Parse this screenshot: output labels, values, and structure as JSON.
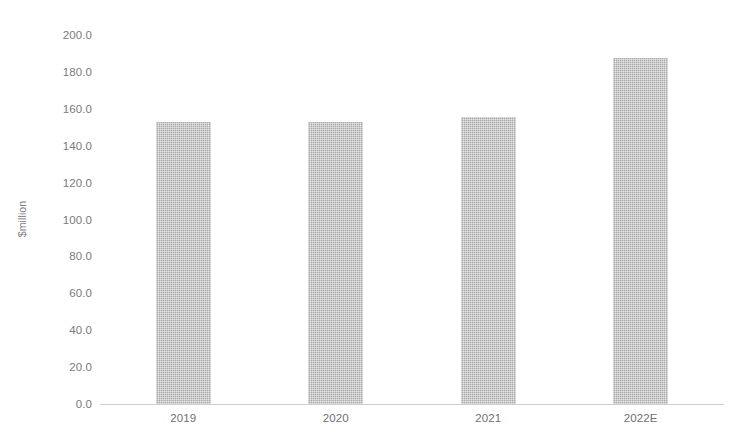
{
  "figure": {
    "caption_fragment": "Exhibit 17: Trends in global pharmaceutical packaging market revenue, 2019-2022E",
    "caption_visible": false
  },
  "chart_data": {
    "type": "bar",
    "title": "",
    "categories": [
      "2019",
      "2020",
      "2021",
      "2022E"
    ],
    "values": [
      153.0,
      153.0,
      155.5,
      187.5
    ],
    "series": [
      {
        "name": "Revenue",
        "values": [
          153.0,
          153.0,
          155.5,
          187.5
        ]
      }
    ],
    "xlabel": "",
    "ylabel": "$million",
    "ylim": [
      0,
      200
    ],
    "ytick_step": 20,
    "ytick_labels": [
      "200.0",
      "180.0",
      "160.0",
      "140.0",
      "120.0",
      "100.0",
      "80.0",
      "60.0",
      "40.0",
      "20.0",
      "0.0"
    ],
    "ytick_values": [
      200,
      180,
      160,
      140,
      120,
      100,
      80,
      60,
      40,
      20,
      0
    ],
    "grid": false,
    "legend": false,
    "legend_position": "none",
    "bar_color": "#a9a9a9",
    "axis_color": "#cfcfcf",
    "text_color": "#7a7a7a",
    "background": "#ffffff"
  }
}
